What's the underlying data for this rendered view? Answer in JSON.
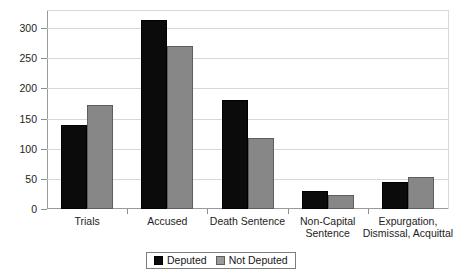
{
  "chart_data": {
    "type": "bar",
    "title": "",
    "subtitle": "",
    "xlabel": "",
    "ylabel": "",
    "ylim": [
      0,
      330
    ],
    "grid": true,
    "legend_position": "bottom-center",
    "categories": [
      "Trials",
      "Accused",
      "Death Sentence",
      "Non-Capital\nSentence",
      "Expurgation,\nDismissal, Acquittal"
    ],
    "category_lines": [
      [
        "Trials"
      ],
      [
        "Accused"
      ],
      [
        "Death Sentence"
      ],
      [
        "Non-Capital",
        "Sentence"
      ],
      [
        "Expurgation,",
        "Dismissal, Acquittal"
      ]
    ],
    "yticks": [
      0,
      50,
      100,
      150,
      200,
      250,
      300
    ],
    "ytick_labels": [
      "0",
      "50",
      "100",
      "150",
      "200",
      "250",
      "300"
    ],
    "series": [
      {
        "name": "Deputed",
        "color": "#0b0b0b",
        "values": [
          139,
          313,
          180,
          30,
          45
        ]
      },
      {
        "name": "Not Deputed",
        "color": "#878787",
        "values": [
          173,
          271,
          117,
          23,
          53
        ]
      }
    ],
    "legend_entries": [
      {
        "label": "Deputed",
        "swatch": "black-square-swatch"
      },
      {
        "label": "Not Deputed",
        "swatch": "gray-square-swatch"
      }
    ]
  }
}
